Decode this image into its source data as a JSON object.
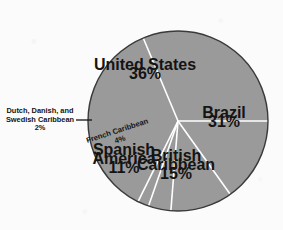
{
  "chart_data": {
    "type": "pie",
    "title": "",
    "subtitle": "",
    "xlabel": "",
    "ylabel": "",
    "legend_position": "none",
    "grid": false,
    "units": "percent",
    "total": 99,
    "fill_color": "#9a9a9a",
    "separator_color": "#ffffff",
    "outline_color": "#3a3a3a",
    "background_color": "#fbfbfb",
    "label_color": "#141414",
    "center": {
      "x": 178,
      "y": 121
    },
    "radius": 90,
    "start_angle_deg": 0,
    "direction": "counterclockwise",
    "slices": [
      {
        "name": "Brazil",
        "value": 31,
        "pct_label": "31%",
        "label_style": "inside",
        "label_x": 224,
        "label_y": 118,
        "rotation": 0
      },
      {
        "name": "United States",
        "value": 36,
        "pct_label": "36%",
        "label_style": "inside",
        "label_x": 145,
        "label_y": 70,
        "rotation": 0
      },
      {
        "name": "Dutch, Danish, and Swedish Caribbean",
        "value": 2,
        "pct_label": "2%",
        "label_style": "callout-left",
        "label_lines": [
          "Dutch, Danish, and",
          "Swedish Caribbean",
          "2%"
        ],
        "label_x": 40,
        "label_y": 113,
        "rotation": 0,
        "leader_from_x": 76,
        "leader_from_y": 120,
        "leader_to_x": 92,
        "leader_to_y": 120
      },
      {
        "name": "French Caribbean",
        "value": 4,
        "pct_label": "4%",
        "label_style": "inside-rotated",
        "label_x": 118,
        "label_y": 133,
        "rotation": -18
      },
      {
        "name": "Spanish America",
        "value": 11,
        "pct_label": "11%",
        "label_lines": [
          "Spanish",
          "America",
          "11%"
        ],
        "label_style": "inside",
        "label_x": 124,
        "label_y": 155,
        "rotation": 0
      },
      {
        "name": "British Caribbean",
        "value": 15,
        "pct_label": "15%",
        "label_lines": [
          "British",
          "Caribbean",
          "15%"
        ],
        "label_style": "inside",
        "label_x": 176,
        "label_y": 161,
        "rotation": 0
      }
    ]
  }
}
